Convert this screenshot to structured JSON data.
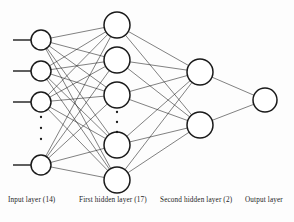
{
  "figure": {
    "kind": "neural-network-architecture-diagram",
    "background_color": "#fdfdfd",
    "stroke_color": "#1a1a1a",
    "node_fill": "#ffffff"
  },
  "captions": {
    "input": "Input layer (14)",
    "hidden1": "First hidden layer (17)",
    "hidden2": "Second hidden layer (2)",
    "output": "Output layer"
  },
  "network": {
    "layers": [
      {
        "id": "input",
        "label": "Input layer (14)",
        "unit_count": 14,
        "drawn_nodes": 4,
        "has_ellipsis": true,
        "ellipsis_after_node": 3,
        "node_radius": 10,
        "x": 41,
        "node_y": [
          40,
          71,
          102,
          165
        ],
        "ellipsis_y": [
          117,
          128,
          139
        ],
        "has_input_stubs": true,
        "stub_length": 18
      },
      {
        "id": "hidden1",
        "label": "First hidden layer (17)",
        "unit_count": 17,
        "drawn_nodes": 5,
        "has_ellipsis": true,
        "ellipsis_after_node": 3,
        "node_radius": 13,
        "x": 117,
        "node_y": [
          25,
          60,
          95,
          145,
          180
        ],
        "ellipsis_y": [
          112,
          122,
          132
        ]
      },
      {
        "id": "hidden2",
        "label": "Second hidden layer (2)",
        "unit_count": 2,
        "drawn_nodes": 2,
        "has_ellipsis": false,
        "node_radius": 13,
        "x": 200,
        "node_y": [
          72,
          125
        ]
      },
      {
        "id": "output",
        "label": "Output layer",
        "unit_count": 1,
        "drawn_nodes": 1,
        "has_ellipsis": false,
        "node_radius": 12,
        "x": 265,
        "node_y": [
          100
        ]
      }
    ],
    "connections": [
      {
        "from": "input",
        "to": "hidden1",
        "style": "fully-connected"
      },
      {
        "from": "hidden1",
        "to": "hidden2",
        "style": "fully-connected"
      },
      {
        "from": "hidden2",
        "to": "output",
        "style": "fully-connected"
      }
    ]
  }
}
